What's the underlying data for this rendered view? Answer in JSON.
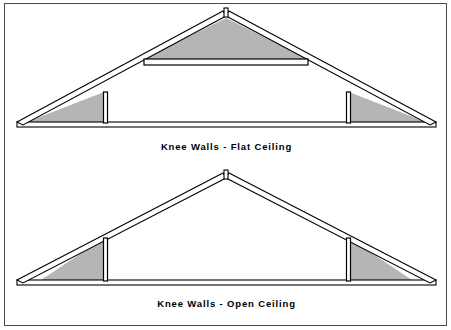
{
  "figure": {
    "background_color": "#ffffff",
    "border_color": "#4a4a4a",
    "line_color": "#000000",
    "insulation_fill_color": "#b5b5b5"
  },
  "panels": [
    {
      "id": "flat-ceiling",
      "caption": "Knee Walls - Flat Ceiling",
      "description": "Gable roof cross-section with two vertical knee walls, a flat collar-tie ceiling, shaded insulation in the side triangles and above the flat ceiling.",
      "parts": [
        "ridge-stub",
        "left-rafter",
        "right-rafter",
        "floor-joist",
        "left-knee-wall",
        "right-knee-wall",
        "flat-ceiling-tie",
        "left-insulation-triangle",
        "right-insulation-triangle",
        "attic-insulation-triangle"
      ]
    },
    {
      "id": "open-ceiling",
      "caption": "Knee Walls - Open Ceiling",
      "description": "Gable roof cross-section with two vertical knee walls and an open cathedral ceiling, shaded insulation only in the side triangles.",
      "parts": [
        "ridge-stub",
        "left-rafter",
        "right-rafter",
        "floor-joist",
        "left-knee-wall",
        "right-knee-wall",
        "left-insulation-triangle",
        "right-insulation-triangle"
      ]
    }
  ],
  "geometry": {
    "flat": {
      "apex_x": 221,
      "apex_y": 10,
      "ridge_stub_top_y": 6,
      "left_eave_x": 12,
      "right_eave_x": 431,
      "floor_y": 122,
      "knee_left_x": 99,
      "knee_right_x": 344,
      "knee_top_y": 88,
      "collar_y": 58
    },
    "open": {
      "apex_x": 221,
      "apex_y": 10,
      "ridge_stub_top_y": 6,
      "left_eave_x": 12,
      "right_eave_x": 431,
      "floor_y": 118,
      "knee_left_x": 99,
      "knee_right_x": 344,
      "knee_top_y": 72
    }
  }
}
